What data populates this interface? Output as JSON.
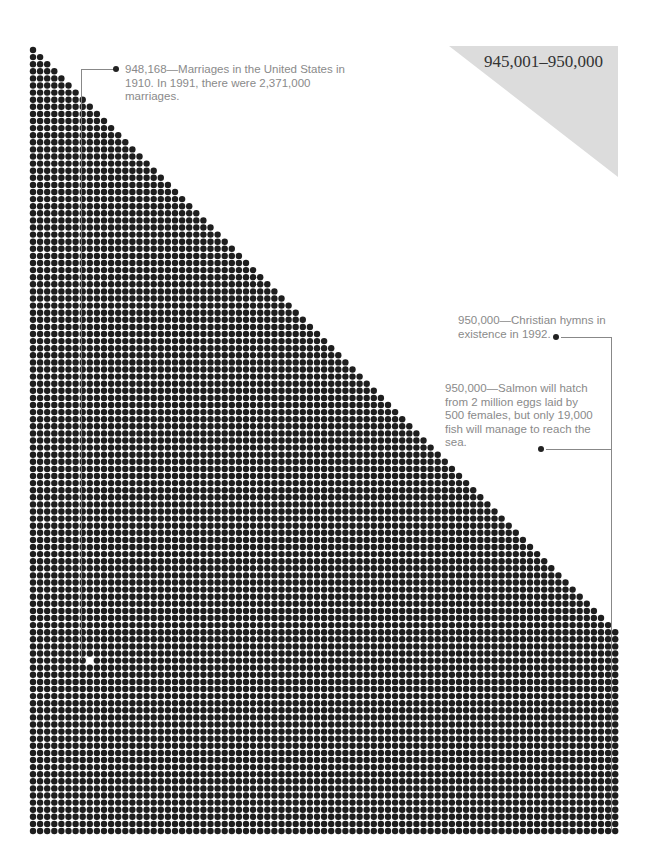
{
  "range": {
    "label": "945,001–950,000"
  },
  "annotations": [
    {
      "text": "948,168—Marriages in the United States in 1910. In 1991, there were 2,371,000 marriages."
    },
    {
      "text": "950,000—Christian hymns in existence in 1992."
    },
    {
      "text": "950,000—Salmon will hatch from 2 million eggs laid by 500 females, but only 19,000 fish will manage to reach the sea."
    }
  ],
  "grid": {
    "x0": 33,
    "y0": 50,
    "step": 7.1,
    "cols": 83,
    "rows": 111,
    "dot_color": "#1e1e1e",
    "highlight": {
      "row": 86,
      "col": 8
    }
  }
}
